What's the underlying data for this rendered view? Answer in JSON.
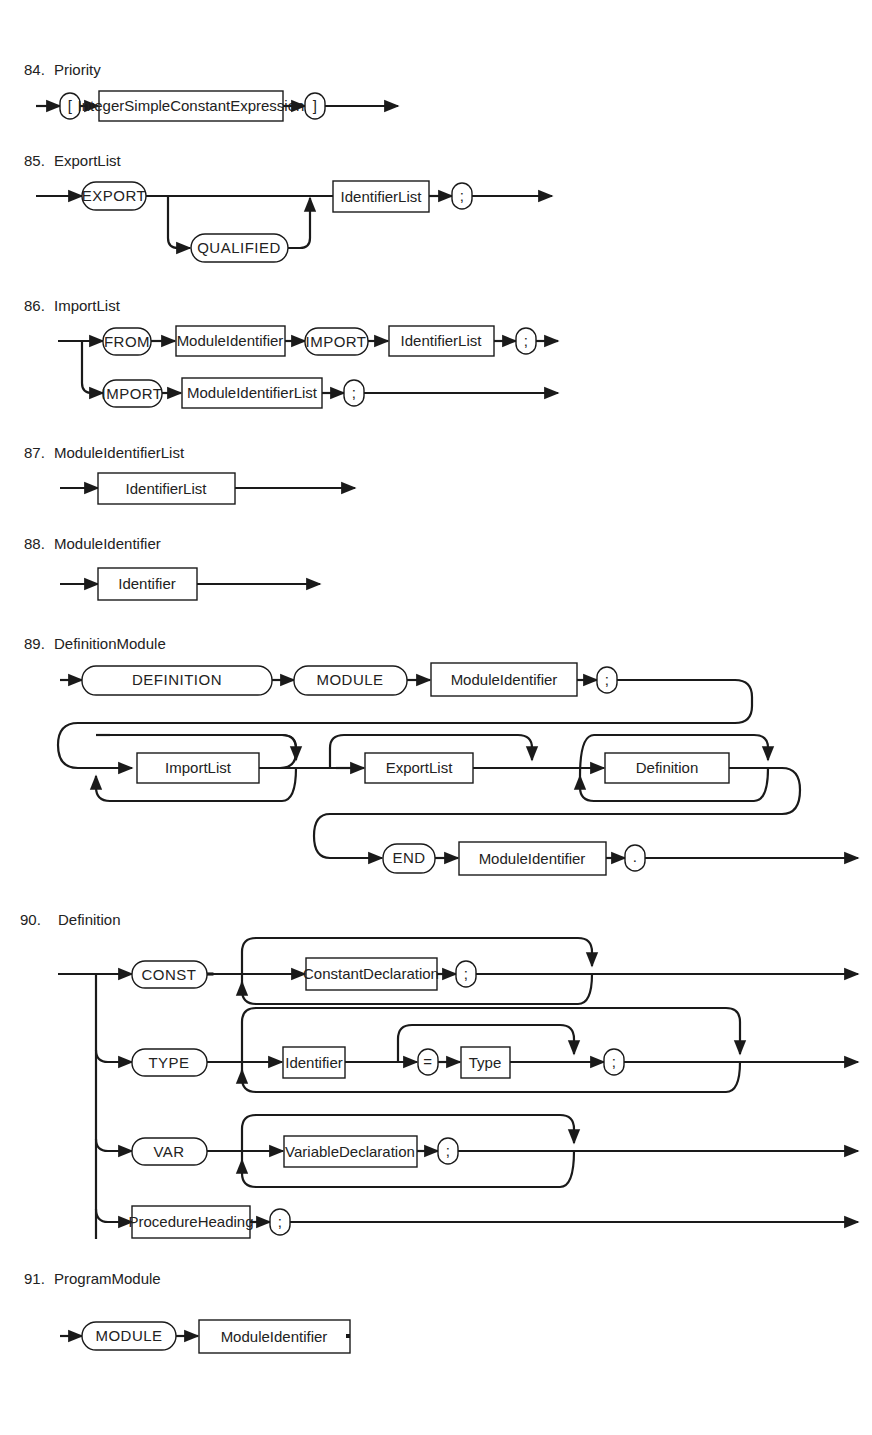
{
  "page": {
    "background": "#ffffff",
    "ink": "#1a1a1a"
  },
  "rules": [
    {
      "number": "84.",
      "name": "Priority",
      "elements": [
        {
          "kind": "terminal",
          "text": "["
        },
        {
          "kind": "nonterminal",
          "text": "IntegerSimpleConstantExpression"
        },
        {
          "kind": "terminal",
          "text": "]"
        }
      ]
    },
    {
      "number": "85.",
      "name": "ExportList",
      "elements": [
        {
          "kind": "terminal",
          "text": "EXPORT"
        },
        {
          "kind": "terminal",
          "text": "QUALIFIED",
          "optional": true
        },
        {
          "kind": "nonterminal",
          "text": "IdentifierList"
        },
        {
          "kind": "terminal",
          "text": ";"
        }
      ]
    },
    {
      "number": "86.",
      "name": "ImportList",
      "branches": [
        [
          {
            "kind": "terminal",
            "text": "FROM"
          },
          {
            "kind": "nonterminal",
            "text": "ModuleIdentifier"
          },
          {
            "kind": "terminal",
            "text": "IMPORT"
          },
          {
            "kind": "nonterminal",
            "text": "IdentifierList"
          },
          {
            "kind": "terminal",
            "text": ";"
          }
        ],
        [
          {
            "kind": "terminal",
            "text": "IMPORT"
          },
          {
            "kind": "nonterminal",
            "text": "ModuleIdentifierList"
          },
          {
            "kind": "terminal",
            "text": ";"
          }
        ]
      ]
    },
    {
      "number": "87.",
      "name": "ModuleIdentifierList",
      "elements": [
        {
          "kind": "nonterminal",
          "text": "IdentifierList"
        }
      ]
    },
    {
      "number": "88.",
      "name": "ModuleIdentifier",
      "elements": [
        {
          "kind": "nonterminal",
          "text": "Identifier"
        }
      ]
    },
    {
      "number": "89.",
      "name": "DefinitionModule",
      "rows": [
        [
          {
            "kind": "terminal",
            "text": "DEFINITION"
          },
          {
            "kind": "terminal",
            "text": "MODULE"
          },
          {
            "kind": "nonterminal",
            "text": "ModuleIdentifier"
          },
          {
            "kind": "terminal",
            "text": ";"
          }
        ],
        [
          {
            "kind": "nonterminal",
            "text": "ImportList",
            "repeat": "zero-or-more"
          },
          {
            "kind": "nonterminal",
            "text": "ExportList",
            "optional": true
          },
          {
            "kind": "nonterminal",
            "text": "Definition",
            "repeat": "zero-or-more"
          }
        ],
        [
          {
            "kind": "terminal",
            "text": "END"
          },
          {
            "kind": "nonterminal",
            "text": "ModuleIdentifier"
          },
          {
            "kind": "terminal",
            "text": "."
          }
        ]
      ]
    },
    {
      "number": "90.",
      "name": "Definition",
      "branches": [
        [
          {
            "kind": "terminal",
            "text": "CONST"
          },
          {
            "kind": "nonterminal",
            "text": "ConstantDeclaration"
          },
          {
            "kind": "terminal",
            "text": ";"
          }
        ],
        [
          {
            "kind": "terminal",
            "text": "TYPE"
          },
          {
            "kind": "nonterminal",
            "text": "Identifier"
          },
          {
            "kind": "terminal",
            "text": "="
          },
          {
            "kind": "nonterminal",
            "text": "Type"
          },
          {
            "kind": "terminal",
            "text": ";"
          }
        ],
        [
          {
            "kind": "terminal",
            "text": "VAR"
          },
          {
            "kind": "nonterminal",
            "text": "VariableDeclaration"
          },
          {
            "kind": "terminal",
            "text": ";"
          }
        ],
        [
          {
            "kind": "nonterminal",
            "text": "ProcedureHeading"
          },
          {
            "kind": "terminal",
            "text": ";"
          }
        ]
      ]
    },
    {
      "number": "91.",
      "name": "ProgramModule",
      "rows": [
        [
          {
            "kind": "terminal",
            "text": "MODULE"
          },
          {
            "kind": "nonterminal",
            "text": "ModuleIdentifier"
          },
          {
            "kind": "nonterminal",
            "text": "Priority",
            "optional": true
          },
          {
            "kind": "terminal",
            "text": ";"
          }
        ],
        [
          {
            "kind": "nonterminal",
            "text": "ImportList",
            "repeat": "zero-or-more"
          },
          {
            "kind": "nonterminal",
            "text": "Block"
          },
          {
            "kind": "nonterminal",
            "text": "ModuleIdentifier"
          },
          {
            "kind": "terminal",
            "text": "."
          }
        ]
      ]
    }
  ]
}
